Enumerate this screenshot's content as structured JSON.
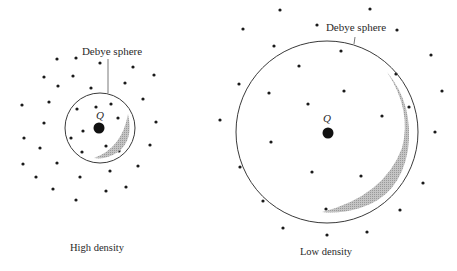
{
  "figure": {
    "width": 457,
    "height": 271,
    "colors": {
      "ink": "#1a1a1a",
      "circle": "#3a3a3a",
      "shade": "#b5b5b5",
      "background": "#ffffff"
    },
    "panels": [
      {
        "id": "high-density",
        "caption": "High density",
        "sphere_label": "Debye sphere",
        "charge_label": "Q",
        "sphere": {
          "cx": 100,
          "cy": 128,
          "r": 35
        },
        "charge": {
          "cx": 99,
          "cy": 128,
          "r": 5.5
        },
        "charge_label_pos": {
          "x": 100,
          "y": 119
        },
        "label_pos": {
          "x": 112,
          "y": 55
        },
        "leader": {
          "x1": 108,
          "y1": 59,
          "x2": 108,
          "y2": 93
        },
        "caption_pos": {
          "x": 97,
          "y": 251
        },
        "crescent": "M94,158 Q122,148 128,114 Q134,140 118,152 Q106,160 94,158 Z",
        "particles": [
          [
            57,
            59
          ],
          [
            76,
            58
          ],
          [
            100,
            63
          ],
          [
            133,
            67
          ],
          [
            154,
            75
          ],
          [
            44,
            77
          ],
          [
            73,
            76
          ],
          [
            58,
            86
          ],
          [
            125,
            83
          ],
          [
            91,
            88
          ],
          [
            143,
            99
          ],
          [
            22,
            105
          ],
          [
            49,
            102
          ],
          [
            77,
            109
          ],
          [
            96,
            107
          ],
          [
            111,
            104
          ],
          [
            118,
            118
          ],
          [
            44,
            123
          ],
          [
            83,
            131
          ],
          [
            71,
            138
          ],
          [
            156,
            122
          ],
          [
            24,
            138
          ],
          [
            40,
            148
          ],
          [
            106,
            146
          ],
          [
            126,
            135
          ],
          [
            82,
            152
          ],
          [
            119,
            151
          ],
          [
            150,
            145
          ],
          [
            23,
            164
          ],
          [
            57,
            163
          ],
          [
            138,
            166
          ],
          [
            110,
            171
          ],
          [
            36,
            177
          ],
          [
            80,
            177
          ],
          [
            53,
            189
          ],
          [
            106,
            191
          ],
          [
            126,
            187
          ],
          [
            76,
            200
          ]
        ]
      },
      {
        "id": "low-density",
        "caption": "Low density",
        "sphere_label": "Debye sphere",
        "charge_label": "Q",
        "sphere": {
          "cx": 327,
          "cy": 132,
          "r": 91
        },
        "charge": {
          "cx": 328,
          "cy": 133,
          "r": 5.5
        },
        "charge_label_pos": {
          "x": 327,
          "y": 122
        },
        "label_pos": {
          "x": 356,
          "y": 31
        },
        "leader": {
          "x1": 355,
          "y1": 37,
          "x2": 354,
          "y2": 44
        },
        "caption_pos": {
          "x": 326,
          "y": 255
        },
        "crescent": "M322,212 Q384,196 402,148 Q412,110 387,72 Q414,104 408,150 Q400,196 360,208 Q340,214 322,212 Z",
        "particles": [
          [
            280,
            10
          ],
          [
            370,
            9
          ],
          [
            243,
            29
          ],
          [
            317,
            25
          ],
          [
            397,
            30
          ],
          [
            274,
            46
          ],
          [
            341,
            51
          ],
          [
            299,
            66
          ],
          [
            431,
            55
          ],
          [
            239,
            84
          ],
          [
            269,
            93
          ],
          [
            344,
            91
          ],
          [
            308,
            104
          ],
          [
            396,
            74
          ],
          [
            442,
            91
          ],
          [
            409,
            107
          ],
          [
            382,
            116
          ],
          [
            220,
            120
          ],
          [
            435,
            132
          ],
          [
            271,
            142
          ],
          [
            240,
            167
          ],
          [
            312,
            172
          ],
          [
            361,
            176
          ],
          [
            388,
            184
          ],
          [
            423,
            183
          ],
          [
            263,
            201
          ],
          [
            326,
            209
          ],
          [
            400,
            210
          ],
          [
            283,
            228
          ],
          [
            327,
            235
          ],
          [
            367,
            232
          ]
        ]
      }
    ]
  }
}
